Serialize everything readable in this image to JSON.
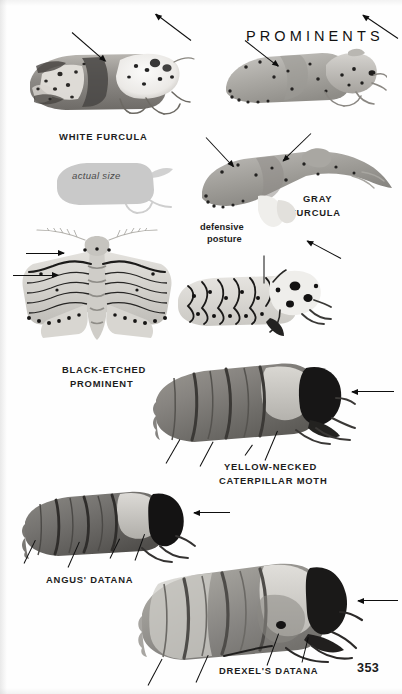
{
  "page": {
    "title": "PROMINENTS",
    "page_number": "353",
    "background_color": "#fefefe",
    "text_color": "#1d1d1d"
  },
  "captions": {
    "white_furcula": "WHITE FURCULA",
    "gray_furcula_line1": "GRAY",
    "gray_furcula_line2": "FURCULA",
    "defensive_line1": "defensive",
    "defensive_line2": "posture",
    "actual_size": "actual size",
    "black_etched_line1": "BLACK-ETCHED",
    "black_etched_line2": "PROMINENT",
    "yellow_necked_line1": "YELLOW-NECKED",
    "yellow_necked_line2": "CATERPILLAR MOTH",
    "angus_datana": "ANGUS' DATANA",
    "drexels_datana": "DREXEL'S DATANA"
  },
  "specimens": [
    {
      "id": "white-furcula",
      "common_name": "WHITE FURCULA"
    },
    {
      "id": "gray-furcula",
      "common_name": "GRAY FURCULA"
    },
    {
      "id": "gray-furcula-defensive",
      "common_name": "defensive posture"
    },
    {
      "id": "black-etched-prominent",
      "common_name": "BLACK-ETCHED PROMINENT"
    },
    {
      "id": "black-etched-lateral",
      "common_name": "BLACK-ETCHED PROMINENT"
    },
    {
      "id": "yellow-necked-caterpillar-moth",
      "common_name": "YELLOW-NECKED CATERPILLAR MOTH"
    },
    {
      "id": "angus-datana",
      "common_name": "ANGUS' DATANA"
    },
    {
      "id": "drexels-datana",
      "common_name": "DREXEL'S DATANA"
    }
  ],
  "actual_size_silhouette": {
    "label": "actual size",
    "fill": "#c9c9c9"
  }
}
